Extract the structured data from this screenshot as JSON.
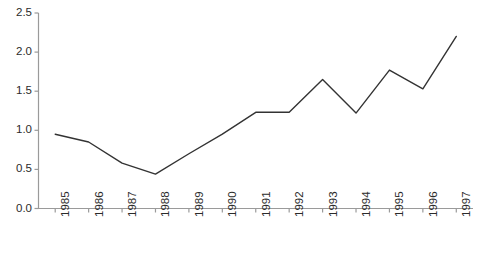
{
  "chart_data": {
    "type": "line",
    "title": "",
    "subtitle": "",
    "xlabel": "",
    "ylabel": "",
    "categories": [
      "1985",
      "1986",
      "1987",
      "1988",
      "1989",
      "1990",
      "1991",
      "1992",
      "1993",
      "1994",
      "1995",
      "1996",
      "1997"
    ],
    "values": [
      0.95,
      0.85,
      0.58,
      0.44,
      0.7,
      0.95,
      1.23,
      1.23,
      1.65,
      1.22,
      1.77,
      1.53,
      2.2
    ],
    "series": [
      {
        "name": "",
        "values": [
          0.95,
          0.85,
          0.58,
          0.44,
          0.7,
          0.95,
          1.23,
          1.23,
          1.65,
          1.22,
          1.77,
          1.53,
          2.2
        ]
      }
    ],
    "ylim": [
      0.0,
      2.5
    ],
    "ytick_labels": [
      "0.0",
      "0.5",
      "1.0",
      "1.5",
      "2.0",
      "2.5"
    ],
    "ytick_values": [
      0.0,
      0.5,
      1.0,
      1.5,
      2.0,
      2.5
    ],
    "xtick_labels": [
      "1985",
      "1986",
      "1987",
      "1988",
      "1989",
      "1990",
      "1991",
      "1992",
      "1993",
      "1994",
      "1995",
      "1996",
      "1997"
    ],
    "grid": false,
    "legend": false,
    "legend_position": "none",
    "annotations": [],
    "markers": false,
    "xtick_label_rotation": -90,
    "colors": {
      "line": "#333333",
      "axis": "#9a9a9a",
      "tick_label": "#2b2b2b",
      "background": "#ffffff"
    }
  }
}
